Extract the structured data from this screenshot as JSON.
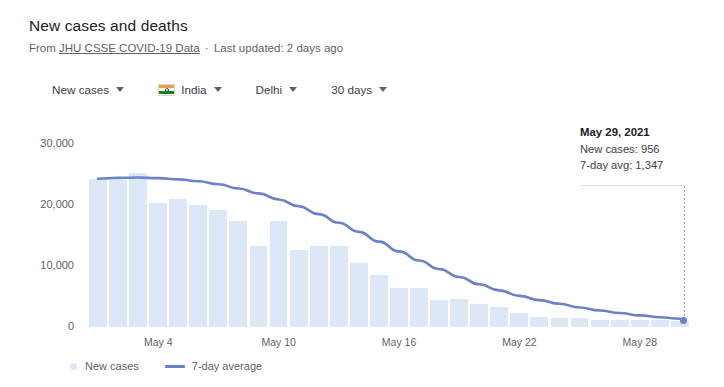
{
  "header": {
    "title": "New cases and deaths",
    "from_prefix": "From",
    "source_link": "JHU CSSE COVID-19 Data",
    "separator": "·",
    "updated": "Last updated: 2 days ago"
  },
  "controls": [
    {
      "label": "New cases",
      "icon": "chevron-down-icon",
      "has_flag": false
    },
    {
      "label": "India",
      "icon": "chevron-down-icon",
      "has_flag": true
    },
    {
      "label": "Delhi",
      "icon": "chevron-down-icon",
      "has_flag": false
    },
    {
      "label": "30 days",
      "icon": "chevron-down-icon",
      "has_flag": false
    }
  ],
  "tooltip": {
    "date": "May 29, 2021",
    "new_cases": "New cases: 956",
    "avg": "7-day avg: 1,347"
  },
  "legend": [
    {
      "label": "New cases",
      "marker": "dot",
      "color": "#dce8f8"
    },
    {
      "label": "7-day average",
      "marker": "line",
      "color": "#6b81c9"
    }
  ],
  "colors": {
    "bar": "#dce8f8",
    "line": "#6b81c9",
    "text": "#202124",
    "muted": "#5f6368"
  },
  "chart_data": {
    "type": "bar",
    "title": "New cases and deaths",
    "subtitle": "From JHU CSSE COVID-19 Data · Last updated: 2 days ago",
    "xlabel": "",
    "ylabel": "",
    "ylim": [
      0,
      30000
    ],
    "yticks": [
      0,
      10000,
      20000,
      30000
    ],
    "ytick_labels": [
      "0",
      "10,000",
      "20,000",
      "30,000"
    ],
    "grid": false,
    "legend_position": "bottom-left",
    "x_tick_labels": [
      "May 4",
      "May 10",
      "May 16",
      "May 22",
      "May 28"
    ],
    "x_tick_indices": [
      3,
      9,
      15,
      21,
      27
    ],
    "categories": [
      "Apr 30",
      "May 1",
      "May 2",
      "May 3",
      "May 4",
      "May 5",
      "May 6",
      "May 7",
      "May 8",
      "May 9",
      "May 10",
      "May 11",
      "May 12",
      "May 13",
      "May 14",
      "May 15",
      "May 16",
      "May 17",
      "May 18",
      "May 19",
      "May 20",
      "May 21",
      "May 22",
      "May 23",
      "May 24",
      "May 25",
      "May 26",
      "May 27",
      "May 28",
      "May 29"
    ],
    "series": [
      {
        "name": "New cases",
        "type": "bar",
        "color": "#dce8f8",
        "values": [
          24235,
          24100,
          25219,
          20394,
          20960,
          19953,
          19133,
          17364,
          13336,
          17403,
          12651,
          13287,
          13340,
          10489,
          8506,
          6430,
          6456,
          4482,
          4524,
          3846,
          3231,
          2260,
          1649,
          1550,
          1491,
          1141,
          1072,
          1141,
          1072,
          956
        ]
      },
      {
        "name": "7-day average",
        "type": "line",
        "color": "#6b81c9",
        "values": [
          24300,
          24450,
          24500,
          24400,
          24200,
          23900,
          23400,
          22700,
          21900,
          20900,
          19800,
          18500,
          17100,
          15600,
          14000,
          12400,
          10900,
          9500,
          8200,
          7000,
          6000,
          5100,
          4400,
          3800,
          3200,
          2700,
          2300,
          1900,
          1600,
          1347
        ]
      }
    ],
    "annotations": [
      {
        "type": "tooltip",
        "x": "May 29, 2021",
        "new_cases": 956,
        "seven_day_avg": 1347
      }
    ]
  }
}
